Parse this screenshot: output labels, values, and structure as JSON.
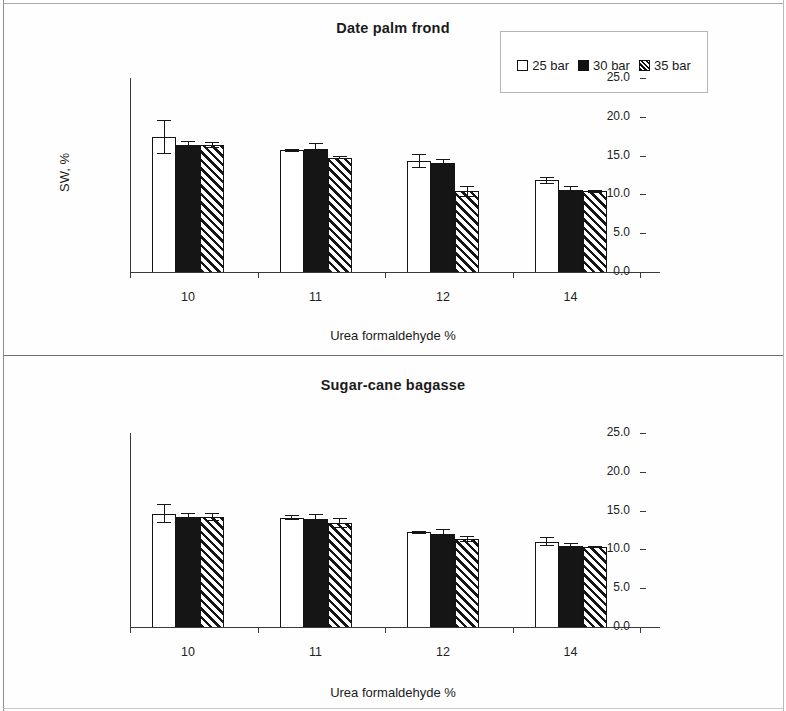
{
  "figure": {
    "background": "#fefefe",
    "axis_color": "#3a3a3a",
    "bar_outline": "#141414",
    "series_colors": [
      "#ffffff",
      "#151515",
      "hatched"
    ]
  },
  "legend": {
    "items": [
      {
        "label": "25 bar",
        "swatch": "white-square-icon"
      },
      {
        "label": "30 bar",
        "swatch": "black-square-icon"
      },
      {
        "label": "35 bar",
        "swatch": "hatched-square-icon"
      }
    ]
  },
  "chart_data": [
    {
      "type": "bar",
      "title": "Date palm frond",
      "xlabel": "Urea formaldehyde %",
      "ylabel": "SW, %",
      "categories": [
        "10",
        "11",
        "12",
        "14"
      ],
      "ylim": [
        0.0,
        25.0
      ],
      "yticks": [
        "0.0",
        "5.0",
        "10.0",
        "15.0",
        "20.0",
        "25.0"
      ],
      "ytick_values": [
        0.0,
        5.0,
        10.0,
        15.0,
        20.0,
        25.0
      ],
      "grid": false,
      "legend_position": "top-right",
      "series": [
        {
          "name": "25 bar",
          "values": [
            17.4,
            15.7,
            14.3,
            11.8
          ],
          "errors": [
            2.2,
            0.2,
            0.9,
            0.5
          ]
        },
        {
          "name": "30 bar",
          "values": [
            16.4,
            15.9,
            14.1,
            10.6
          ],
          "errors": [
            0.5,
            0.7,
            0.4,
            0.5
          ]
        },
        {
          "name": "35 bar",
          "values": [
            16.4,
            14.7,
            10.4,
            10.4
          ],
          "errors": [
            0.4,
            0.2,
            0.7,
            0.2
          ]
        }
      ]
    },
    {
      "type": "bar",
      "title": "Sugar-cane bagasse",
      "xlabel": "Urea formaldehyde %",
      "ylabel": "SW, %",
      "categories": [
        "10",
        "11",
        "12",
        "14"
      ],
      "ylim": [
        0.0,
        25.0
      ],
      "yticks": [
        "0.0",
        "5.0",
        "10.0",
        "15.0",
        "20.0",
        "25.0"
      ],
      "ytick_values": [
        0.0,
        5.0,
        10.0,
        15.0,
        20.0,
        25.0
      ],
      "grid": false,
      "legend_position": "none",
      "series": [
        {
          "name": "25 bar",
          "values": [
            14.6,
            14.1,
            12.2,
            11.0
          ],
          "errors": [
            1.2,
            0.3,
            0.2,
            0.6
          ]
        },
        {
          "name": "30 bar",
          "values": [
            14.2,
            13.9,
            12.0,
            10.4
          ],
          "errors": [
            0.5,
            0.6,
            0.6,
            0.4
          ]
        },
        {
          "name": "35 bar",
          "values": [
            14.2,
            13.4,
            11.3,
            10.3
          ],
          "errors": [
            0.5,
            0.6,
            0.4,
            0.1
          ]
        }
      ]
    }
  ]
}
